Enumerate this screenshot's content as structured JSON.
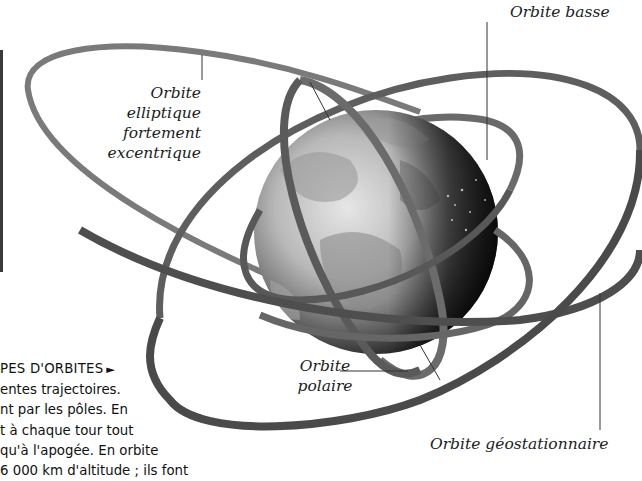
{
  "figure": {
    "labels": {
      "low_orbit": "Orbite basse",
      "elliptical_orbit": [
        "Orbite elliptique",
        "fortement",
        "excentrique"
      ],
      "polar_orbit": [
        "Orbite",
        "polaire"
      ],
      "geostationary_orbit": "Orbite géostationnaire"
    },
    "colors": {
      "ribbon": "#6e6e6e",
      "ribbon_dark": "#3c3c3c",
      "earth_light": "#d9d9d9",
      "earth_dark": "#2a2a2a",
      "leader_line": "#333333"
    }
  },
  "caption": {
    "heading": "PES D'ORBITES",
    "heading_arrow": "►",
    "lines": [
      "entes trajectoires.",
      "nt par les pôles. En",
      "t à chaque tour tout",
      "qu'à l'apogée. En orbite",
      "6 000 km d'altitude ; ils font"
    ]
  }
}
